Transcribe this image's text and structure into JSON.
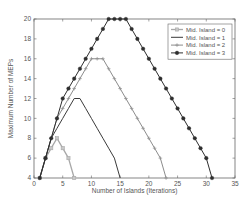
{
  "chart_data": {
    "type": "line",
    "title": "",
    "xlabel": "Number of Islands (Iterations)",
    "ylabel": "Maximum Number of MEPs",
    "xlim": [
      0,
      35
    ],
    "ylim": [
      4,
      20
    ],
    "xticks": [
      0,
      5,
      10,
      15,
      20,
      25,
      30,
      35
    ],
    "yticks": [
      4,
      6,
      8,
      10,
      12,
      14,
      16,
      18,
      20
    ],
    "grid": false,
    "legend_position": "upper right",
    "series": [
      {
        "name": "Mid. Island = 0",
        "color": "#a8a8a8",
        "marker": "square",
        "x": [
          1,
          2,
          3,
          4,
          5,
          6,
          7
        ],
        "y": [
          4,
          6,
          7,
          8,
          7,
          6,
          4
        ]
      },
      {
        "name": "Mid. Island = 1",
        "color": "#3a3a3a",
        "marker": "none",
        "x": [
          1,
          2,
          3,
          4,
          5,
          6,
          7,
          8,
          9,
          10,
          11,
          12,
          13,
          14,
          15
        ],
        "y": [
          4,
          6,
          8,
          9,
          10,
          11,
          12,
          12,
          11,
          10,
          9,
          8,
          7,
          6,
          4
        ]
      },
      {
        "name": "Mid. Island = 2",
        "color": "#8c8c8c",
        "marker": "plus",
        "x": [
          1,
          2,
          3,
          4,
          5,
          6,
          7,
          8,
          9,
          10,
          11,
          12,
          13,
          14,
          15,
          16,
          17,
          18,
          19,
          20,
          21,
          22,
          23
        ],
        "y": [
          4,
          6,
          8,
          10,
          11,
          12,
          13,
          14,
          15,
          16,
          16,
          16,
          15,
          14,
          13,
          12,
          11,
          10,
          9,
          8,
          7,
          6,
          4
        ]
      },
      {
        "name": "Mid. Island = 3",
        "color": "#2e2e2e",
        "marker": "circle",
        "x": [
          1,
          2,
          3,
          4,
          5,
          6,
          7,
          8,
          9,
          10,
          11,
          12,
          13,
          14,
          15,
          16,
          17,
          18,
          19,
          20,
          21,
          22,
          23,
          24,
          25,
          26,
          27,
          28,
          29,
          30,
          31
        ],
        "y": [
          4,
          6,
          8,
          10,
          12,
          13,
          14,
          15,
          16,
          17,
          18,
          19,
          20,
          20,
          20,
          20,
          19,
          18,
          17,
          16,
          15,
          14,
          13,
          12,
          11,
          10,
          9,
          8,
          7,
          6,
          4
        ]
      }
    ]
  },
  "layout": {
    "plot": {
      "left": 34,
      "top": 19,
      "right": 235,
      "bottom": 178
    }
  }
}
